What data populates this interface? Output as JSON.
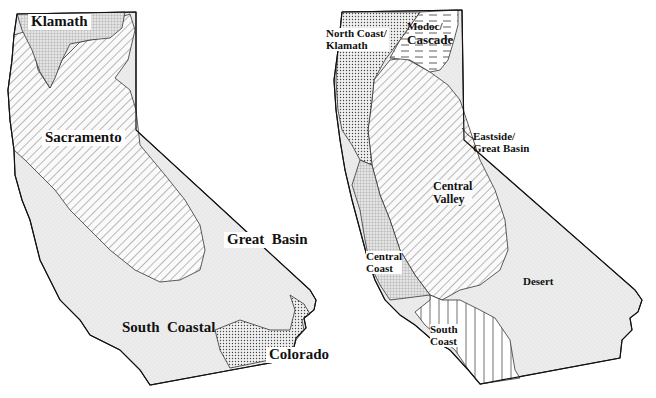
{
  "left_map": {
    "title": "Hydrologic regions (historic)",
    "regions": [
      {
        "id": "klamath",
        "label": "Klamath",
        "pattern": "grid"
      },
      {
        "id": "sacramento",
        "label": "Sacramento",
        "pattern": "diagonal-hatch"
      },
      {
        "id": "great_basin",
        "label": "Great  Basin",
        "pattern": "light-stipple"
      },
      {
        "id": "south_coastal",
        "label": "South  Coastal",
        "pattern": "light-stipple"
      },
      {
        "id": "colorado",
        "label": "Colorado",
        "pattern": "dense-dots"
      }
    ]
  },
  "right_map": {
    "regions": [
      {
        "id": "north_coast_klamath",
        "label_line1": "North Coast/",
        "label_line2": "Klamath",
        "pattern": "dense-dots"
      },
      {
        "id": "modoc_cascade",
        "label_line1": "Modoc/",
        "label_line2": "Cascade",
        "pattern": "horizontal-dashes"
      },
      {
        "id": "eastside_great_basin",
        "label_line1": "Eastside/",
        "label_line2": "Great Basin",
        "pattern": "light-stipple"
      },
      {
        "id": "central_valley",
        "label_line1": "Central",
        "label_line2": "Valley",
        "pattern": "diagonal-hatch"
      },
      {
        "id": "central_coast",
        "label_line1": "Central",
        "label_line2": "Coast",
        "pattern": "grid"
      },
      {
        "id": "desert",
        "label_line1": "Desert",
        "label_line2": "",
        "pattern": "light-stipple"
      },
      {
        "id": "south_coast",
        "label_line1": "South",
        "label_line2": "Coast",
        "pattern": "vertical-lines"
      }
    ]
  }
}
